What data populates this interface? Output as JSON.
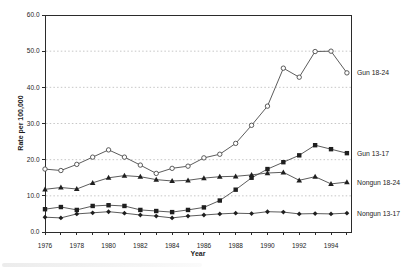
{
  "chart_data": {
    "type": "line",
    "title": "",
    "xlabel": "Year",
    "ylabel": "Rate per 100,000",
    "x_start": 1976,
    "x_end": 1995,
    "x_tick_years": [
      1976,
      1977,
      1978,
      1979,
      1980,
      1981,
      1982,
      1983,
      1984,
      1985,
      1986,
      1987,
      1988,
      1989,
      1990,
      1991,
      1992,
      1993,
      1994,
      1995
    ],
    "x_label_years": [
      1976,
      1978,
      1980,
      1982,
      1984,
      1986,
      1988,
      1990,
      1992,
      1994
    ],
    "y_ticks": [
      0,
      10,
      20,
      30,
      40,
      50,
      60
    ],
    "y_tick_labels": [
      "0.0",
      "10.0",
      "20.0",
      "30.0",
      "40.0",
      "50.0",
      "60.0"
    ],
    "ylim": [
      0,
      60
    ],
    "grid": "horizontal-dotted",
    "legend_position": "right-end-labels",
    "series": [
      {
        "name": "Gun 18-24",
        "marker": "circle-open",
        "values": [
          17.4,
          17.0,
          18.7,
          20.7,
          22.7,
          20.7,
          18.5,
          16.2,
          17.6,
          18.2,
          20.5,
          21.5,
          24.5,
          29.5,
          34.8,
          45.3,
          42.8,
          49.9,
          50.0,
          44.0
        ]
      },
      {
        "name": "Gun 13-17",
        "marker": "square-filled",
        "values": [
          6.3,
          6.9,
          6.1,
          7.2,
          7.4,
          7.2,
          6.1,
          5.8,
          5.5,
          6.1,
          6.8,
          8.7,
          11.7,
          15.0,
          17.4,
          19.3,
          21.2,
          24.0,
          22.9,
          21.8
        ]
      },
      {
        "name": "Nongun 18-24",
        "marker": "triangle-filled",
        "values": [
          11.8,
          12.3,
          11.9,
          13.6,
          15.0,
          15.6,
          15.3,
          14.5,
          14.1,
          14.3,
          14.9,
          15.3,
          15.4,
          15.8,
          16.3,
          16.5,
          14.3,
          15.3,
          13.3,
          13.8
        ]
      },
      {
        "name": "Nongun 13-17",
        "marker": "diamond-filled",
        "values": [
          4.1,
          3.9,
          5.0,
          5.3,
          5.6,
          5.2,
          4.7,
          4.4,
          3.9,
          4.4,
          4.7,
          5.0,
          5.2,
          5.1,
          5.6,
          5.5,
          5.0,
          5.1,
          5.0,
          5.2
        ]
      }
    ],
    "colors": {
      "line": "#4a4a4a",
      "marker_fill": "#1f1f1f",
      "marker_open_fill": "#ffffff",
      "grid": "#b8b8b8",
      "axis": "#2b2b2b",
      "text": "#1c1c1c",
      "background": "#ffffff"
    }
  }
}
